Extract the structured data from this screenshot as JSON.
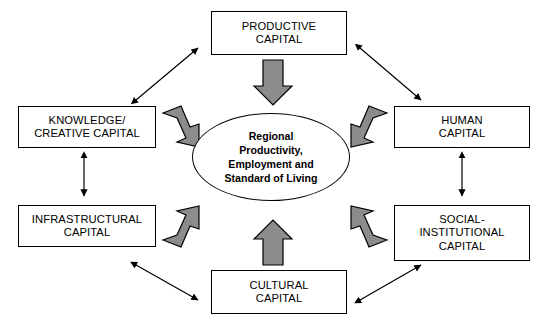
{
  "diagram": {
    "colors": {
      "block_arrow_fill": "#8c8c8c",
      "block_arrow_stroke": "#000000",
      "line_arrow": "#000000",
      "box_border": "#000000",
      "background": "#ffffff"
    },
    "center": {
      "label": "Regional\nProductivity,\nEmployment and\nStandard of Living",
      "shape": "ellipse"
    },
    "nodes": [
      {
        "id": "productive",
        "label": "PRODUCTIVE\nCAPITAL"
      },
      {
        "id": "knowledge",
        "label": "KNOWLEDGE/\nCREATIVE CAPITAL"
      },
      {
        "id": "human",
        "label": "HUMAN\nCAPITAL"
      },
      {
        "id": "infrastructural",
        "label": "INFRASTRUCTURAL\nCAPITAL"
      },
      {
        "id": "social",
        "label": "SOCIAL-\nINSTITUTIONAL\nCAPITAL"
      },
      {
        "id": "cultural",
        "label": "CULTURAL\nCAPITAL"
      }
    ],
    "block_arrows": [
      {
        "id": "productive-to-center",
        "from": "productive",
        "to": "center",
        "direction": "down"
      },
      {
        "id": "knowledge-to-center",
        "from": "knowledge",
        "to": "center",
        "direction": "down-right"
      },
      {
        "id": "human-to-center",
        "from": "human",
        "to": "center",
        "direction": "down-left"
      },
      {
        "id": "infrastructural-to-center",
        "from": "infrastructural",
        "to": "center",
        "direction": "up-right"
      },
      {
        "id": "social-to-center",
        "from": "social",
        "to": "center",
        "direction": "up-left"
      },
      {
        "id": "cultural-to-center",
        "from": "cultural",
        "to": "center",
        "direction": "up"
      }
    ],
    "link_arrows": [
      {
        "id": "knowledge-productive",
        "from": "knowledge",
        "to": "productive",
        "style": "double-headed"
      },
      {
        "id": "productive-human",
        "from": "productive",
        "to": "human",
        "style": "double-headed"
      },
      {
        "id": "knowledge-infrastructural",
        "from": "knowledge",
        "to": "infrastructural",
        "style": "double-headed"
      },
      {
        "id": "human-social",
        "from": "human",
        "to": "social",
        "style": "double-headed"
      },
      {
        "id": "infrastructural-cultural",
        "from": "infrastructural",
        "to": "cultural",
        "style": "double-headed"
      },
      {
        "id": "cultural-social",
        "from": "cultural",
        "to": "social",
        "style": "double-headed"
      }
    ]
  }
}
